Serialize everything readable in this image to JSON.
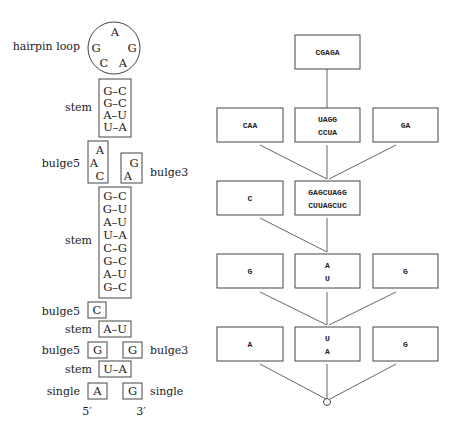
{
  "left": {
    "hairpin": {
      "label": "hairpin loop",
      "bases": [
        "A",
        "G",
        "G",
        "C",
        "A"
      ]
    },
    "stem1": {
      "label": "stem",
      "pairs": [
        "G–C",
        "G–C",
        "A–U",
        "U–A"
      ]
    },
    "bulge_a": {
      "left_label": "bulge5",
      "left_bases": [
        "A",
        "A",
        "C"
      ],
      "right_label": "bulge3",
      "right_bases": [
        "G",
        "A"
      ]
    },
    "stem2": {
      "label": "stem",
      "pairs": [
        "G–C",
        "G–U",
        "A–U",
        "U–A",
        "C–G",
        "G–C",
        "A–U",
        "G–C"
      ]
    },
    "bulge_b": {
      "label": "bulge5",
      "base": "C"
    },
    "stem3": {
      "label": "stem",
      "pair": "A–U"
    },
    "bulge_c": {
      "left_label": "bulge5",
      "left_base": "G",
      "right_label": "bulge3",
      "right_base": "G"
    },
    "stem4": {
      "label": "stem",
      "pair": "U–A"
    },
    "single": {
      "left_label": "single",
      "left_base": "A",
      "right_label": "single",
      "right_base": "G"
    },
    "ends": {
      "five_prime": "5′",
      "three_prime": "3′"
    }
  },
  "tree": {
    "level0": {
      "center": "CGAGA"
    },
    "level1": {
      "left": "CAA",
      "center_top": "UAGG",
      "center_bottom": "CCUA",
      "right": "GA"
    },
    "level2": {
      "left": "C",
      "center_top": "GAGCUAGG",
      "center_bottom": "CUUAGCUC"
    },
    "level3": {
      "left": "G",
      "center_top": "A",
      "center_bottom": "U",
      "right": "G"
    },
    "level4": {
      "left": "A",
      "center_top": "U",
      "center_bottom": "A",
      "right": "G"
    }
  }
}
